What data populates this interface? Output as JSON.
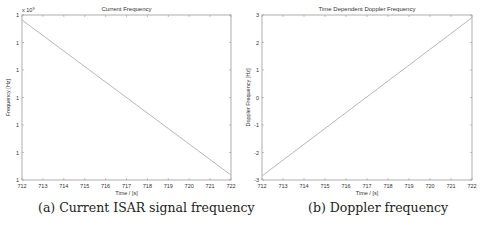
{
  "chart_data": [
    {
      "type": "line",
      "title": "Current Frequency",
      "xlabel": "Time / [s]",
      "ylabel": "Frequency [Hz]",
      "y_exponent_label": "x 10",
      "y_exponent_power": "9",
      "xlim": [
        712,
        722
      ],
      "x_ticks": [
        "712",
        "713",
        "714",
        "715",
        "716",
        "717",
        "718",
        "719",
        "720",
        "721",
        "722"
      ],
      "y_ticks": [
        "1",
        "1",
        "1",
        "1",
        "1",
        "1",
        "1"
      ],
      "grid": false,
      "legend": null,
      "series": [
        {
          "name": "current frequency",
          "x": [
            712,
            722
          ],
          "y_norm": [
            0.97,
            0.03
          ],
          "color": "#b8b8b8"
        }
      ],
      "caption": "(a) Current ISAR signal frequency"
    },
    {
      "type": "line",
      "title": "Time Dependent Doppler Frequency",
      "xlabel": "Time / [s]",
      "ylabel": "Doppler Frequency [Hz]",
      "xlim": [
        712,
        722
      ],
      "ylim": [
        -3,
        3
      ],
      "x_ticks": [
        "712",
        "713",
        "714",
        "715",
        "716",
        "717",
        "718",
        "719",
        "720",
        "721",
        "722"
      ],
      "y_ticks": [
        "3",
        "2",
        "1",
        "0",
        "-1",
        "-2",
        "-3"
      ],
      "grid": false,
      "legend": null,
      "series": [
        {
          "name": "doppler frequency",
          "x": [
            712,
            722
          ],
          "y": [
            -2.85,
            2.9
          ],
          "color": "#b8b8b8"
        }
      ],
      "caption": "(b) Doppler frequency"
    }
  ]
}
